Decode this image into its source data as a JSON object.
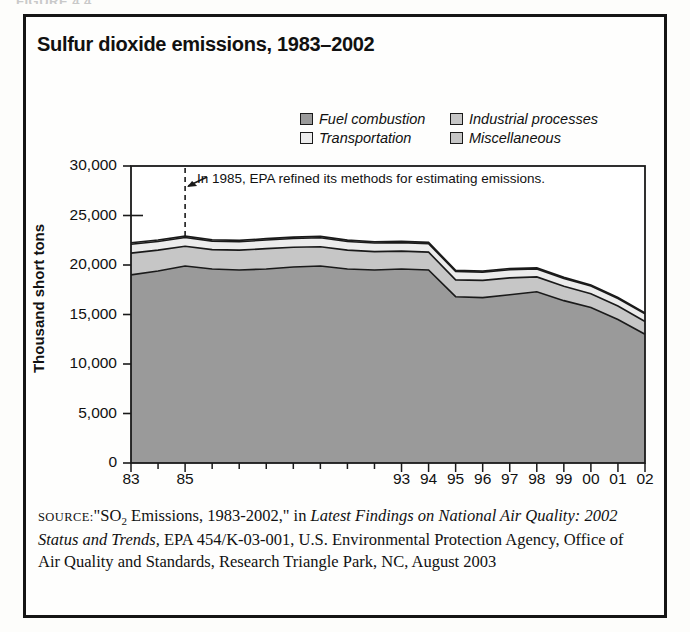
{
  "figure": {
    "caption_partial": "FIGURE 4.4"
  },
  "chart_title": "Sulfur dioxide emissions, 1983–2002",
  "annotation": {
    "text": "In 1985, EPA refined its methods for estimating emissions.",
    "year": 1985
  },
  "legend": {
    "items": [
      {
        "label": "Fuel combustion",
        "color": "#9a9a9a",
        "key": "fuel_combustion"
      },
      {
        "label": "Industrial processes",
        "color": "#c6c6c6",
        "key": "industrial_processes"
      },
      {
        "label": "Transportation",
        "color": "#ececec",
        "key": "transportation"
      },
      {
        "label": "Miscellaneous",
        "color": "#c6c6c6",
        "key": "miscellaneous"
      }
    ]
  },
  "source": {
    "label": "SOURCE:",
    "line1_a": "\"SO",
    "line1_sub": "2",
    "line1_b": " Emissions, 1983-2002,\" in ",
    "italic1": "Latest Findings on National Air Quality: 2002 Status and Trends,",
    "rest": " EPA 454/K-03-001, U.S. Environmental Protection Agency, Office of Air Quality and Standards, Research Triangle Park, NC, August 2003"
  },
  "chart_data": {
    "type": "area",
    "stacked": true,
    "title": "Sulfur dioxide emissions, 1983–2002",
    "xlabel": "",
    "ylabel": "Thousand short tons",
    "ylim": [
      0,
      30000
    ],
    "yticks": [
      0,
      5000,
      10000,
      15000,
      20000,
      25000,
      30000
    ],
    "ytick_labels": [
      "0",
      "5,000",
      "10,000",
      "15,000",
      "20,000",
      "25,000",
      "30,000"
    ],
    "grid": false,
    "legend_position": "top-right",
    "x": [
      1983,
      1984,
      1985,
      1986,
      1987,
      1988,
      1989,
      1990,
      1991,
      1992,
      1993,
      1994,
      1995,
      1996,
      1997,
      1998,
      1999,
      2000,
      2001,
      2002
    ],
    "categories": [
      "83",
      "84",
      "85",
      "86",
      "87",
      "88",
      "89",
      "90",
      "91",
      "92",
      "93",
      "94",
      "95",
      "96",
      "97",
      "98",
      "99",
      "00",
      "01",
      "02"
    ],
    "xtick_labels_shown": [
      "83",
      "85",
      "93",
      "94",
      "95",
      "96",
      "97",
      "98",
      "99",
      "00",
      "01",
      "02"
    ],
    "series": [
      {
        "name": "Fuel combustion",
        "color": "#9a9a9a",
        "values": [
          19000,
          19400,
          19900,
          19600,
          19500,
          19600,
          19800,
          19900,
          19600,
          19500,
          19600,
          19500,
          16800,
          16700,
          17000,
          17300,
          16400,
          15700,
          14500,
          13000
        ]
      },
      {
        "name": "Industrial processes",
        "color": "#c6c6c6",
        "values": [
          2200,
          2100,
          2000,
          1950,
          2000,
          2050,
          2000,
          1950,
          1900,
          1850,
          1800,
          1800,
          1700,
          1750,
          1700,
          1500,
          1450,
          1400,
          1350,
          1300
        ]
      },
      {
        "name": "Transportation",
        "color": "#ececec",
        "values": [
          900,
          880,
          870,
          860,
          850,
          870,
          880,
          900,
          880,
          870,
          860,
          860,
          840,
          830,
          820,
          800,
          790,
          780,
          770,
          760
        ]
      },
      {
        "name": "Miscellaneous",
        "color": "#c6c6c6",
        "values": [
          150,
          150,
          150,
          140,
          140,
          140,
          140,
          140,
          130,
          130,
          130,
          130,
          120,
          120,
          120,
          110,
          110,
          110,
          100,
          100
        ]
      }
    ],
    "totals": [
      22250,
      22530,
      22920,
      22550,
      22490,
      22660,
      22820,
      22890,
      22510,
      22350,
      22390,
      22290,
      19460,
      19400,
      19640,
      19710,
      18750,
      17990,
      16720,
      15160
    ],
    "annotations": [
      {
        "x": 1985,
        "text": "In 1985, EPA refined its methods for estimating emissions.",
        "style": "dashed-vline"
      }
    ]
  }
}
